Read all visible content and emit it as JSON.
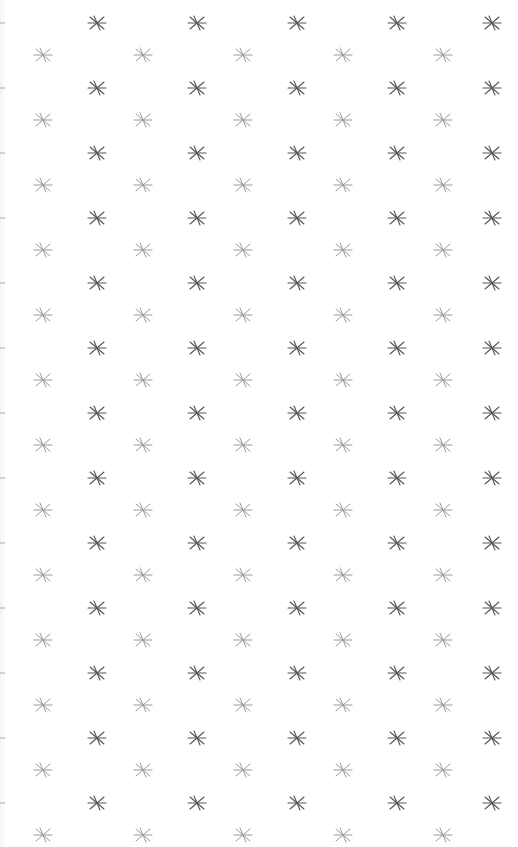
{
  "pattern": {
    "description": "Repeating asterisk/star glyph pattern on white background",
    "background": "#ffffff",
    "dark_star": {
      "color": "#555555",
      "columns_x": [
        97,
        197,
        297,
        397,
        492
      ],
      "first_row_y": 23,
      "row_step": 65,
      "rows": 13
    },
    "light_star": {
      "color": "#9a9a9a",
      "columns_x": [
        43,
        143,
        243,
        343,
        443
      ],
      "first_row_y": 55,
      "row_step": 65,
      "rows": 13
    },
    "edge_marks": {
      "color": "#aaaaaa",
      "x": 2,
      "first_row_y": 23,
      "row_step": 65,
      "rows": 13
    }
  }
}
